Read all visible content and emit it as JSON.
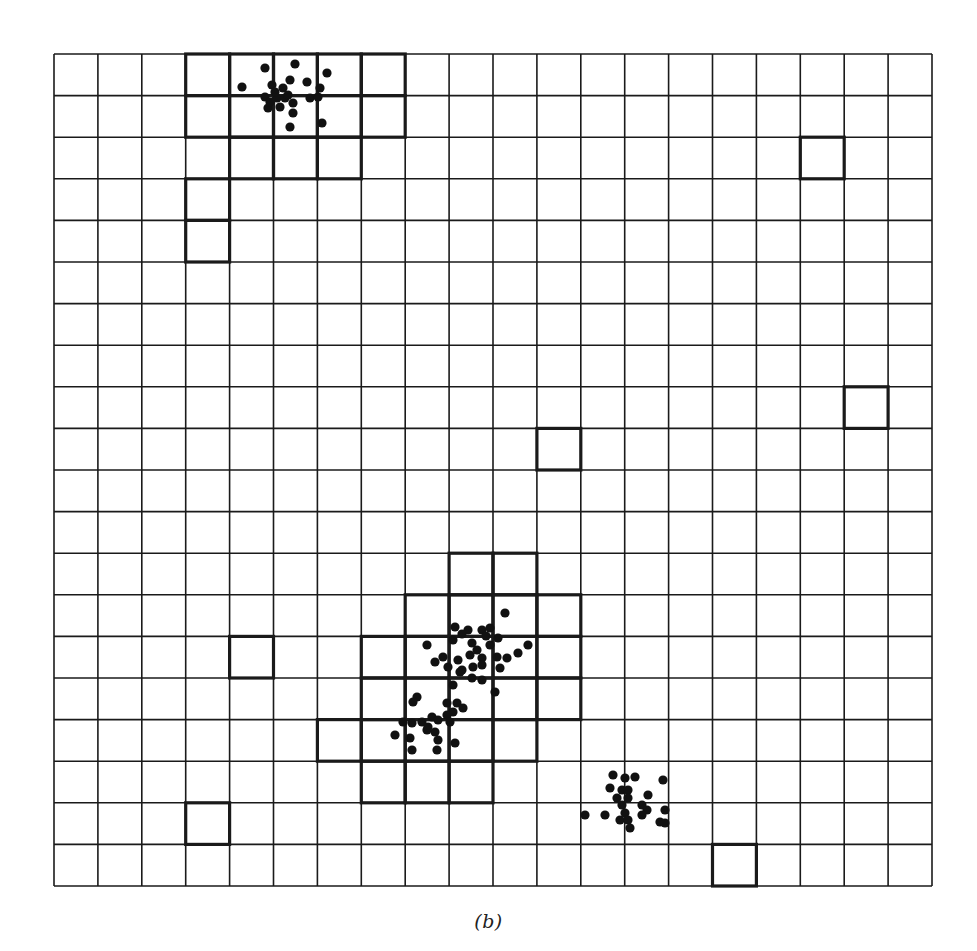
{
  "figure": {
    "caption": "(b)",
    "grid": {
      "cols": 20,
      "rows": 20,
      "left": 54,
      "top": 54,
      "right": 932,
      "bottom": 886,
      "line_color": "#1a1a1a",
      "thin_width": 1.6,
      "thick_width": 3.2
    },
    "highlighted_cells": [
      {
        "group": "top-cluster",
        "cells": [
          [
            0,
            3
          ],
          [
            0,
            4
          ],
          [
            0,
            5
          ],
          [
            0,
            6
          ],
          [
            0,
            7
          ],
          [
            1,
            3
          ],
          [
            1,
            4
          ],
          [
            1,
            5
          ],
          [
            1,
            6
          ],
          [
            1,
            7
          ],
          [
            2,
            4
          ],
          [
            2,
            5
          ],
          [
            2,
            6
          ],
          [
            3,
            3
          ],
          [
            4,
            3
          ]
        ]
      },
      {
        "group": "middle-cluster",
        "cells": [
          [
            12,
            9
          ],
          [
            12,
            10
          ],
          [
            13,
            8
          ],
          [
            13,
            9
          ],
          [
            13,
            10
          ],
          [
            13,
            11
          ],
          [
            14,
            7
          ],
          [
            14,
            8
          ],
          [
            14,
            9
          ],
          [
            14,
            10
          ],
          [
            14,
            11
          ],
          [
            15,
            7
          ],
          [
            15,
            8
          ],
          [
            15,
            9
          ],
          [
            15,
            10
          ],
          [
            15,
            11
          ],
          [
            16,
            6
          ],
          [
            16,
            7
          ],
          [
            16,
            8
          ],
          [
            16,
            9
          ],
          [
            16,
            10
          ],
          [
            17,
            7
          ],
          [
            17,
            8
          ],
          [
            17,
            9
          ]
        ]
      },
      {
        "group": "isolated",
        "cells": [
          [
            2,
            17
          ],
          [
            8,
            18
          ],
          [
            9,
            11
          ],
          [
            14,
            4
          ],
          [
            18,
            3
          ],
          [
            19,
            15
          ]
        ]
      }
    ],
    "point_clusters": [
      {
        "name": "top-cluster",
        "points": [
          [
            265,
            68
          ],
          [
            295,
            64
          ],
          [
            327,
            73
          ],
          [
            242,
            87
          ],
          [
            272,
            85
          ],
          [
            290,
            80
          ],
          [
            307,
            82
          ],
          [
            320,
            88
          ],
          [
            283,
            88
          ],
          [
            265,
            97
          ],
          [
            277,
            98
          ],
          [
            268,
            108
          ],
          [
            280,
            107
          ],
          [
            293,
            103
          ],
          [
            293,
            113
          ],
          [
            310,
            98
          ],
          [
            318,
            97
          ],
          [
            290,
            127
          ],
          [
            322,
            123
          ],
          [
            275,
            92
          ],
          [
            285,
            98
          ],
          [
            270,
            102
          ],
          [
            288,
            95
          ]
        ]
      },
      {
        "name": "middle-cluster",
        "points": [
          [
            505,
            613
          ],
          [
            455,
            627
          ],
          [
            468,
            630
          ],
          [
            482,
            630
          ],
          [
            490,
            628
          ],
          [
            427,
            645
          ],
          [
            528,
            645
          ],
          [
            518,
            653
          ],
          [
            453,
            640
          ],
          [
            472,
            643
          ],
          [
            490,
            645
          ],
          [
            498,
            638
          ],
          [
            435,
            662
          ],
          [
            443,
            657
          ],
          [
            458,
            660
          ],
          [
            470,
            655
          ],
          [
            482,
            658
          ],
          [
            497,
            657
          ],
          [
            507,
            658
          ],
          [
            448,
            667
          ],
          [
            462,
            670
          ],
          [
            473,
            667
          ],
          [
            482,
            665
          ],
          [
            500,
            668
          ],
          [
            460,
            672
          ],
          [
            472,
            678
          ],
          [
            482,
            680
          ],
          [
            453,
            685
          ],
          [
            495,
            692
          ],
          [
            417,
            697
          ],
          [
            413,
            702
          ],
          [
            447,
            703
          ],
          [
            457,
            703
          ],
          [
            463,
            708
          ],
          [
            453,
            712
          ],
          [
            403,
            722
          ],
          [
            412,
            723
          ],
          [
            422,
            722
          ],
          [
            432,
            717
          ],
          [
            438,
            720
          ],
          [
            447,
            715
          ],
          [
            450,
            722
          ],
          [
            395,
            735
          ],
          [
            410,
            738
          ],
          [
            427,
            730
          ],
          [
            435,
            732
          ],
          [
            438,
            740
          ],
          [
            455,
            743
          ],
          [
            412,
            750
          ],
          [
            437,
            750
          ],
          [
            428,
            727
          ],
          [
            486,
            636
          ],
          [
            462,
            634
          ],
          [
            477,
            650
          ]
        ]
      },
      {
        "name": "lower-right-cluster",
        "points": [
          [
            613,
            775
          ],
          [
            625,
            778
          ],
          [
            635,
            777
          ],
          [
            663,
            780
          ],
          [
            610,
            788
          ],
          [
            622,
            790
          ],
          [
            628,
            790
          ],
          [
            648,
            795
          ],
          [
            617,
            798
          ],
          [
            628,
            798
          ],
          [
            622,
            805
          ],
          [
            642,
            805
          ],
          [
            647,
            810
          ],
          [
            665,
            810
          ],
          [
            585,
            815
          ],
          [
            605,
            815
          ],
          [
            625,
            813
          ],
          [
            642,
            815
          ],
          [
            620,
            820
          ],
          [
            628,
            820
          ],
          [
            660,
            822
          ],
          [
            665,
            823
          ],
          [
            630,
            828
          ]
        ]
      }
    ],
    "point_radius": 4.6,
    "point_color": "#111111"
  }
}
